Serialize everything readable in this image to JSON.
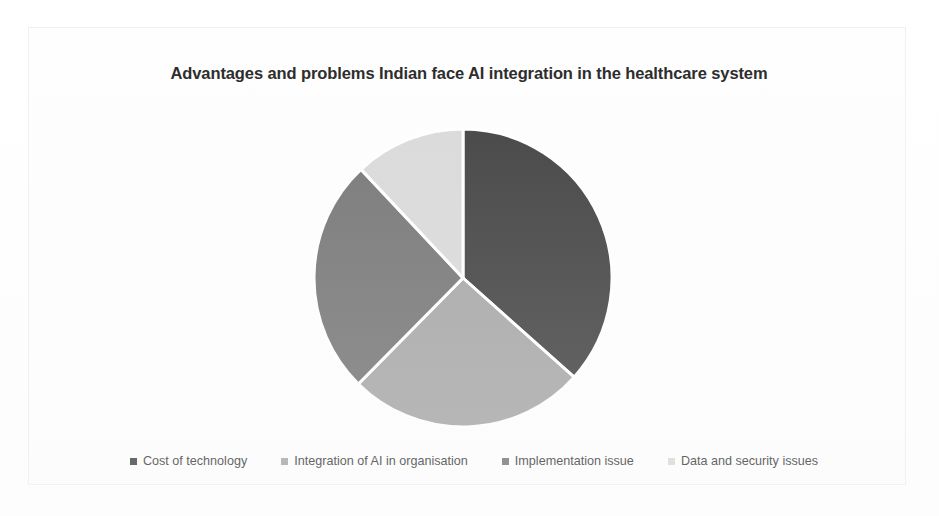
{
  "chart_data": {
    "type": "pie",
    "title": "Advantages and problems Indian face AI integration in the healthcare system",
    "categories": [
      "Cost of technology",
      "Integration of AI in organisation",
      "Implementation issue",
      "Data and security issues"
    ],
    "values": [
      36.6,
      25.8,
      25.6,
      12.0
    ],
    "colors": [
      "#404040",
      "#a6a6a6",
      "#757575",
      "#d9d9d9"
    ],
    "start_angle_deg": 0,
    "direction": "clockwise",
    "slice_border_color": "#ffffff",
    "legend_position": "bottom",
    "grid": false,
    "xlabel": "",
    "ylabel": "",
    "data_labels_shown": false
  },
  "chart": {
    "title": "Advantages and problems Indian face AI integration in the healthcare system",
    "legend": [
      {
        "label": "Cost of technology",
        "color": "#404040"
      },
      {
        "label": "Integration of AI in organisation",
        "color": "#a6a6a6"
      },
      {
        "label": "Implementation issue",
        "color": "#757575"
      },
      {
        "label": "Data and security issues",
        "color": "#d9d9d9"
      }
    ]
  }
}
